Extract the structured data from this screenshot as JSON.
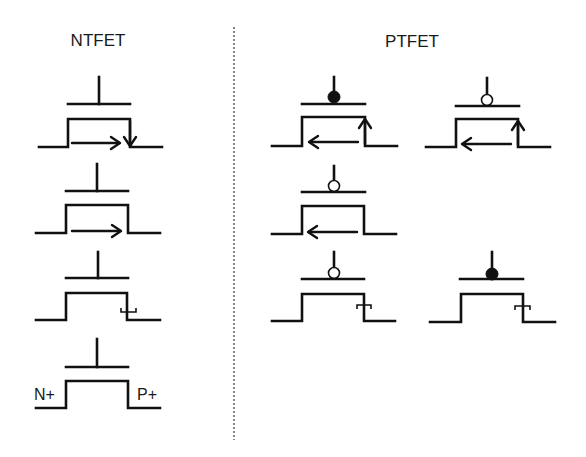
{
  "diagram": {
    "titles": {
      "left": "NTFET",
      "right": "PTFET"
    },
    "labels": {
      "source_doping": "N+",
      "drain_doping": "P+"
    },
    "colors": {
      "stroke": "#111111",
      "background": "#ffffff",
      "divider": "#666666"
    },
    "groups": [
      {
        "name": "NTFET",
        "symbols": [
          {
            "id": "ntfet-1",
            "gate_marker": "none",
            "channel_arrow": "right",
            "drain_marker": "down-arrow"
          },
          {
            "id": "ntfet-2",
            "gate_marker": "none",
            "channel_arrow": "right",
            "drain_marker": "none"
          },
          {
            "id": "ntfet-3",
            "gate_marker": "none",
            "channel_arrow": "none",
            "drain_marker": "tunnel-bracket"
          },
          {
            "id": "ntfet-4",
            "gate_marker": "none",
            "channel_arrow": "none",
            "drain_marker": "none",
            "source_label": "N+",
            "drain_label": "P+"
          }
        ]
      },
      {
        "name": "PTFET",
        "symbols": [
          {
            "id": "ptfet-1",
            "gate_marker": "filled-circle",
            "channel_arrow": "left",
            "drain_marker": "up-arrow"
          },
          {
            "id": "ptfet-2",
            "gate_marker": "open-circle",
            "channel_arrow": "left",
            "drain_marker": "up-arrow"
          },
          {
            "id": "ptfet-3",
            "gate_marker": "open-circle",
            "channel_arrow": "left",
            "drain_marker": "none"
          },
          {
            "id": "ptfet-4",
            "gate_marker": "open-circle",
            "channel_arrow": "none",
            "drain_marker": "tunnel-bracket"
          },
          {
            "id": "ptfet-5",
            "gate_marker": "filled-circle",
            "channel_arrow": "none",
            "drain_marker": "tunnel-bracket"
          }
        ]
      }
    ]
  }
}
